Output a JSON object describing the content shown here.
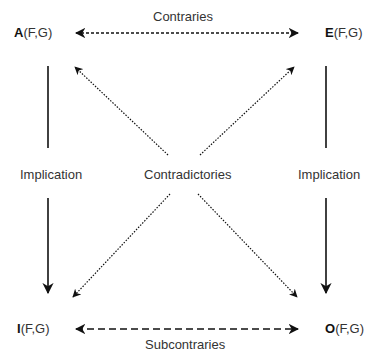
{
  "corners": {
    "A": {
      "letter": "A",
      "args": "(F,G)"
    },
    "E": {
      "letter": "E",
      "args": "(F,G)"
    },
    "I": {
      "letter": "I",
      "args": "(F,G)"
    },
    "O": {
      "letter": "O",
      "args": "(F,G)"
    }
  },
  "relations": {
    "top": "Contraries",
    "bottom": "Subcontraries",
    "left": "Implication",
    "right": "Implication",
    "diagonal": "Contradictories"
  },
  "colors": {
    "line": "#111111",
    "text": "#333333"
  }
}
